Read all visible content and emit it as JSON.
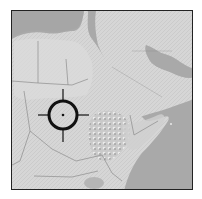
{
  "map": {
    "region": "Northeast Africa and Arabian Peninsula",
    "style": "grayscale shaded relief",
    "colors": {
      "sea": "#a9a9a9",
      "land": "#d4d4d4",
      "land_light": "#e2e2e2",
      "highlands": "#bdbdbd",
      "border": "#8a8a8a",
      "frame": "#222222",
      "crosshair": "#111111"
    }
  },
  "marker": {
    "type": "crosshair-target",
    "center_x": 62,
    "center_y": 114,
    "radius": 14
  }
}
